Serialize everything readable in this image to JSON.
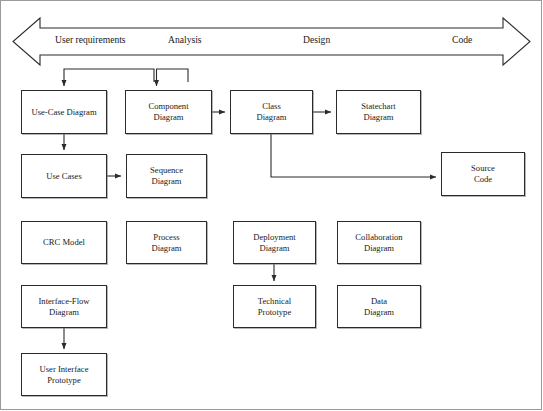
{
  "diagram": {
    "banner": {
      "name": "lifecycle-arrow-banner",
      "direction": "bidirectional",
      "phases": [
        {
          "id": "user-requirements",
          "label": "User requirements",
          "x": 55,
          "y": 40
        },
        {
          "id": "analysis",
          "label": "Analysis",
          "x": 168,
          "y": 40
        },
        {
          "id": "design",
          "label": "Design",
          "x": 303,
          "y": 40
        },
        {
          "id": "code",
          "label": "Code",
          "x": 452,
          "y": 40
        }
      ]
    },
    "nodes": [
      {
        "id": "use-case-diagram",
        "label": "Use-Case Diagram",
        "x": 21,
        "y": 90,
        "w": 86,
        "h": 44
      },
      {
        "id": "component-diagram",
        "label": "Component\nDiagram",
        "x": 125,
        "y": 90,
        "w": 87,
        "h": 44
      },
      {
        "id": "class-diagram",
        "label": "Class\nDiagram",
        "x": 230,
        "y": 90,
        "w": 83,
        "h": 44
      },
      {
        "id": "statechart-diagram",
        "label": "Statechart\nDiagram",
        "x": 336,
        "y": 90,
        "w": 85,
        "h": 44
      },
      {
        "id": "use-cases",
        "label": "Use Cases",
        "x": 21,
        "y": 154,
        "w": 86,
        "h": 44
      },
      {
        "id": "sequence-diagram",
        "label": "Sequence\nDiagram",
        "x": 126,
        "y": 154,
        "w": 81,
        "h": 44
      },
      {
        "id": "source-code",
        "label": "Source\nCode",
        "x": 441,
        "y": 152,
        "w": 84,
        "h": 44
      },
      {
        "id": "crc-model",
        "label": "CRC Model",
        "x": 21,
        "y": 221,
        "w": 86,
        "h": 43
      },
      {
        "id": "process-diagram",
        "label": "Process\nDiagram",
        "x": 126,
        "y": 221,
        "w": 81,
        "h": 43
      },
      {
        "id": "deployment-diagram",
        "label": "Deployment\nDiagram",
        "x": 233,
        "y": 221,
        "w": 83,
        "h": 43
      },
      {
        "id": "collaboration-diagram",
        "label": "Collaboration\nDiagram",
        "x": 337,
        "y": 221,
        "w": 84,
        "h": 43
      },
      {
        "id": "interface-flow-diagram",
        "label": "Interface-Flow\nDiagram",
        "x": 21,
        "y": 285,
        "w": 86,
        "h": 43
      },
      {
        "id": "technical-prototype",
        "label": "Technical\nPrototype",
        "x": 233,
        "y": 285,
        "w": 83,
        "h": 43
      },
      {
        "id": "data-diagram",
        "label": "Data\nDiagram",
        "x": 337,
        "y": 285,
        "w": 84,
        "h": 43
      },
      {
        "id": "user-interface-prototype",
        "label": "User Interface\nPrototype",
        "x": 21,
        "y": 353,
        "w": 86,
        "h": 43
      }
    ],
    "edges": [
      {
        "id": "edge-feedback-into-use-case",
        "from": "component-diagram",
        "to": "use-case-diagram",
        "style": "loop-back"
      },
      {
        "id": "edge-feedback-into-component",
        "from": "class-diagram",
        "to": "component-diagram",
        "style": "loop-back"
      },
      {
        "id": "edge-component-to-class",
        "from": "component-diagram",
        "to": "class-diagram",
        "style": "straight"
      },
      {
        "id": "edge-class-to-statechart",
        "from": "class-diagram",
        "to": "statechart-diagram",
        "style": "straight"
      },
      {
        "id": "edge-use-case-to-use-cases",
        "from": "use-case-diagram",
        "to": "use-cases",
        "style": "straight"
      },
      {
        "id": "edge-use-cases-to-sequence",
        "from": "use-cases",
        "to": "sequence-diagram",
        "style": "straight"
      },
      {
        "id": "edge-class-to-source-code",
        "from": "class-diagram",
        "to": "source-code",
        "style": "elbow"
      },
      {
        "id": "edge-deployment-to-technical",
        "from": "deployment-diagram",
        "to": "technical-prototype",
        "style": "straight"
      },
      {
        "id": "edge-interface-flow-to-ui-proto",
        "from": "interface-flow-diagram",
        "to": "user-interface-prototype",
        "style": "straight"
      }
    ],
    "colors": {
      "stroke": "#2b2b2b",
      "frame": "#9a9a9a",
      "background": "#ffffff",
      "text": "#1a1a1a"
    }
  }
}
